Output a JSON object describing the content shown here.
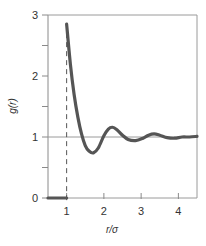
{
  "chart_data": {
    "type": "line",
    "title": "",
    "xlabel": "r/σ",
    "ylabel": "g(r)",
    "xlim": [
      0.5,
      4.5
    ],
    "ylim": [
      0,
      3
    ],
    "grid": false,
    "legend": null,
    "x_ticks": [
      1,
      2,
      3,
      4
    ],
    "x_tick_labels": [
      "1",
      "2",
      "3",
      "4"
    ],
    "y_ticks": [
      0,
      0.5,
      1,
      1.5,
      2,
      2.5,
      3
    ],
    "y_tick_labels": [
      "0",
      "",
      "1",
      "",
      "2",
      "",
      "3"
    ],
    "reference_lines": [
      {
        "orientation": "horizontal",
        "y": 1,
        "style": "solid",
        "color": "#9a9a9a"
      },
      {
        "orientation": "vertical",
        "x": 1,
        "style": "dashed",
        "color": "#555555"
      }
    ],
    "series": [
      {
        "name": "g(r)",
        "color": "#555555",
        "x": [
          0.5,
          1.0,
          1.0,
          1.1,
          1.2,
          1.3,
          1.4,
          1.5,
          1.6,
          1.72,
          1.85,
          2.0,
          2.12,
          2.23,
          2.35,
          2.5,
          2.65,
          2.85,
          3.05,
          3.2,
          3.35,
          3.5,
          3.7,
          3.9,
          4.1,
          4.3,
          4.5
        ],
        "y": [
          0.0,
          0.0,
          2.85,
          2.2,
          1.7,
          1.33,
          1.05,
          0.86,
          0.77,
          0.74,
          0.82,
          1.02,
          1.13,
          1.16,
          1.12,
          1.03,
          0.96,
          0.94,
          0.98,
          1.03,
          1.05,
          1.03,
          0.99,
          0.98,
          1.0,
          1.0,
          1.01
        ]
      }
    ]
  },
  "labels": {
    "xlabel": "r/σ",
    "ylabel": "g(r)",
    "x_ticks": [
      "1",
      "2",
      "3",
      "4"
    ],
    "y_ticks": [
      "0",
      "1",
      "2",
      "3"
    ]
  }
}
